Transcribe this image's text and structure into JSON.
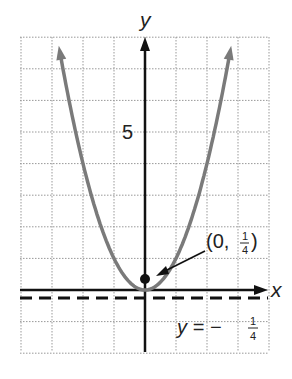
{
  "chart_data": {
    "type": "line",
    "title": "",
    "equation": "y = x^2",
    "xlabel": "x",
    "ylabel": "y",
    "xlim": [
      -4,
      4
    ],
    "ylim": [
      -2,
      8
    ],
    "grid": true,
    "y_tick_labels": [
      {
        "value": 5,
        "label": "5"
      }
    ],
    "series": [
      {
        "name": "parabola",
        "x": [
          -2.83,
          -2,
          -1,
          0,
          1,
          2,
          2.83
        ],
        "values": [
          8,
          4,
          1,
          0,
          1,
          4,
          8
        ],
        "color": "#808080"
      }
    ],
    "annotations": [
      {
        "type": "point",
        "x": 0,
        "y": 0.25,
        "label": "(0, 1/4)",
        "description": "focus"
      },
      {
        "type": "hline",
        "y": -0.25,
        "style": "dashed",
        "label": "y = -1/4",
        "description": "directrix"
      }
    ]
  },
  "labels": {
    "y_axis": "y",
    "x_axis": "x",
    "tick_5": "5",
    "focus_prefix": "(0, ",
    "focus_num": "1",
    "focus_den": "4",
    "focus_suffix": ")",
    "directrix_prefix": "y = −",
    "directrix_num": "1",
    "directrix_den": "4"
  }
}
